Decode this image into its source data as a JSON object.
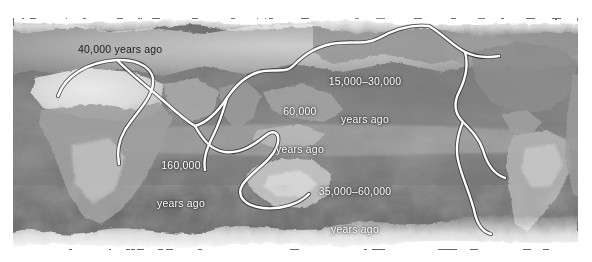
{
  "figure": {
    "kind": "world-map-figure",
    "title_visible": false,
    "background_color": "#ffffff",
    "map": {
      "style": "grayscale-satellite-photograph",
      "projection": "equirectangular-pacific-centered",
      "ocean_tone": "#6b6b6b",
      "land_tone": "#8e8e8e",
      "ice_tone": "#f2f2f2",
      "route_color": "#ffffff",
      "route_outline_color": "#2a2a2a"
    },
    "labels": [
      {
        "id": "lbl-40000",
        "name": "label-40000-years-ago",
        "text": "40,000 years ago",
        "lines": [
          "40,000 years ago"
        ],
        "color": "#1b1b1b",
        "style": "dark"
      },
      {
        "id": "lbl-15000",
        "name": "label-15000-30000-years-ago",
        "text": "15,000–30,000 years ago",
        "lines": [
          "15,000–30,000",
          "years ago"
        ],
        "color": "#ffffff",
        "style": "light"
      },
      {
        "id": "lbl-60000",
        "name": "label-60000-years-ago",
        "text": "60,000 years ago",
        "lines": [
          "60,000",
          "years ago"
        ],
        "color": "#ffffff",
        "style": "light"
      },
      {
        "id": "lbl-160000",
        "name": "label-160000-years-ago",
        "text": "160,000 years ago",
        "lines": [
          "160,000",
          "years ago"
        ],
        "color": "#ffffff",
        "style": "light"
      },
      {
        "id": "lbl-35000",
        "name": "label-35000-60000-years-ago",
        "text": "35,000–60,000 years ago",
        "lines": [
          "35,000–60,000",
          "years ago"
        ],
        "color": "#ffffff",
        "style": "light"
      }
    ],
    "routes": [
      {
        "name": "route-africa-to-europe"
      },
      {
        "name": "route-africa-to-near-east"
      },
      {
        "name": "route-near-east-to-central-asia"
      },
      {
        "name": "route-south-asia-to-southeast-asia"
      },
      {
        "name": "route-southeast-asia-to-australia"
      },
      {
        "name": "route-asia-to-beringia"
      },
      {
        "name": "route-beringia-to-north-america"
      },
      {
        "name": "route-north-america-to-south-america"
      },
      {
        "name": "route-south-america-branch"
      }
    ]
  }
}
